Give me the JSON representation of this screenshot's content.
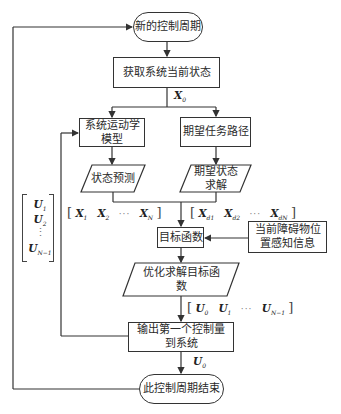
{
  "diagram": {
    "type": "flowchart",
    "nodes": {
      "start": "新的控制周期",
      "get_state": "获取系统当前状态",
      "kinematic_model": "系统运动学模型",
      "desired_path": "期望任务路径",
      "state_prediction": "状态预测",
      "desired_state_solve": "期望状态求解",
      "objective": "目标函数",
      "obstacle_info": "当前障碍物位置感知信息",
      "optimize": "优化求解目标函数",
      "output": "输出第一个控制量到系统",
      "end": "此控制周期结束"
    },
    "labels": {
      "x0": {
        "sym": "X",
        "sub": "0"
      },
      "predicted_states": {
        "items": [
          {
            "sym": "X",
            "sub": "1"
          },
          {
            "sym": "X",
            "sub": "2"
          },
          {
            "sym": "X",
            "sub": "N"
          }
        ],
        "ellipsis": "···"
      },
      "desired_states": {
        "items": [
          {
            "sym": "X",
            "sub": "d1"
          },
          {
            "sym": "X",
            "sub": "d2"
          },
          {
            "sym": "X",
            "sub": "dN"
          }
        ],
        "ellipsis": "···"
      },
      "control_sequence": {
        "items": [
          {
            "sym": "U",
            "sub": "0"
          },
          {
            "sym": "U",
            "sub": "1"
          },
          {
            "sym": "U",
            "sub": "N−1"
          }
        ],
        "ellipsis": "···"
      },
      "feedback_vector": {
        "items": [
          {
            "sym": "U",
            "sub": "1"
          },
          {
            "sym": "U",
            "sub": "2"
          },
          {
            "sym": "U",
            "sub": "N−1"
          }
        ],
        "vdots": "⋮"
      },
      "u0": {
        "sym": "U",
        "sub": "0"
      }
    },
    "edges": [
      [
        "start",
        "get_state"
      ],
      [
        "get_state",
        "kinematic_model",
        "X0"
      ],
      [
        "get_state",
        "desired_path",
        "X0"
      ],
      [
        "kinematic_model",
        "state_prediction"
      ],
      [
        "desired_path",
        "desired_state_solve"
      ],
      [
        "state_prediction",
        "objective",
        "[X1 X2 … XN]"
      ],
      [
        "desired_state_solve",
        "objective",
        "[Xd1 Xd2 … XdN]"
      ],
      [
        "obstacle_info",
        "objective"
      ],
      [
        "objective",
        "optimize"
      ],
      [
        "optimize",
        "output",
        "[U0 U1 … UN-1]"
      ],
      [
        "output",
        "kinematic_model",
        "[U1 U2 … UN-1]ᵀ"
      ],
      [
        "output",
        "end",
        "U0"
      ],
      [
        "end",
        "start"
      ]
    ]
  }
}
